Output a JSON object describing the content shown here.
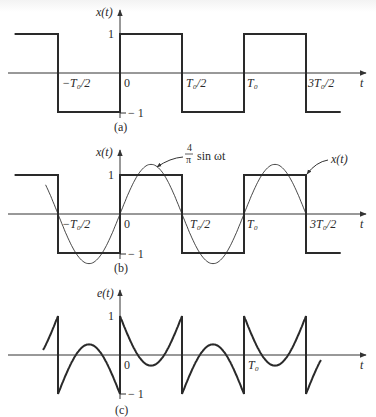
{
  "figure": {
    "x_axis_label": "t",
    "tick_labels": {
      "neg_half": "−T₀/2",
      "zero": "0",
      "half": "T₀/2",
      "t0": "T₀",
      "three_half": "3T₀/2"
    },
    "panels": [
      {
        "id": "a",
        "caption": "(a)",
        "y_axis_label": "x(t)",
        "level_high_label": "1",
        "level_low_label": "− 1",
        "signal": "square wave"
      },
      {
        "id": "b",
        "caption": "(b)",
        "y_axis_label": "x(t)",
        "level_high_label": "1",
        "level_low_label": "− 1",
        "annotation_sine": "4/π sin ωt",
        "annotation_sine_num": "4",
        "annotation_sine_den": "π",
        "annotation_sine_text": "sin ωt",
        "annotation_square": "x(t)",
        "signal": "square wave with fundamental sine approximation"
      },
      {
        "id": "c",
        "caption": "(c)",
        "y_axis_label": "e(t)",
        "level_high_label": "1",
        "level_low_label": "− 1",
        "signal": "error e(t) = x(t) − (4/π) sin ωt"
      }
    ]
  },
  "chart_data": [
    {
      "type": "line",
      "title": "(a) Square wave x(t)",
      "xlabel": "t",
      "ylabel": "x(t)",
      "x_ticks": [
        "−T0/2",
        "0",
        "T0/2",
        "T0",
        "3T0/2"
      ],
      "ylim": [
        -1,
        1
      ],
      "series": [
        {
          "name": "x(t)",
          "x": [
            -0.85,
            -0.5,
            -0.5,
            0,
            0,
            0.5,
            0.5,
            1.0,
            1.0,
            1.5,
            1.5,
            1.78
          ],
          "values": [
            1,
            1,
            -1,
            -1,
            1,
            1,
            -1,
            -1,
            1,
            1,
            -1,
            -1
          ]
        }
      ]
    },
    {
      "type": "line",
      "title": "(b) Square wave with fundamental",
      "xlabel": "t",
      "ylabel": "x(t)",
      "x_ticks": [
        "−T0/2",
        "0",
        "T0/2",
        "T0",
        "3T0/2"
      ],
      "ylim": [
        -1.273,
        1.273
      ],
      "series": [
        {
          "name": "x(t)",
          "x": [
            -0.85,
            -0.5,
            -0.5,
            0,
            0,
            0.5,
            0.5,
            1.0,
            1.0,
            1.5,
            1.5,
            1.78
          ],
          "values": [
            1,
            1,
            -1,
            -1,
            1,
            1,
            -1,
            -1,
            1,
            1,
            -1,
            -1
          ]
        },
        {
          "name": "4/π sin ωt",
          "x_range": [
            -0.6,
            1.5
          ],
          "amplitude": 1.273
        }
      ]
    },
    {
      "type": "line",
      "title": "(c) Error e(t)",
      "xlabel": "t",
      "ylabel": "e(t)",
      "x_ticks": [
        "0",
        "T0"
      ],
      "ylim": [
        -1,
        1
      ],
      "series": [
        {
          "name": "e(t) = x(t) − (4/π) sin ωt",
          "x_range": [
            -0.62,
            1.62
          ],
          "jump_points": [
            -0.5,
            0,
            0.5,
            1.0,
            1.5
          ],
          "local_extrema": 0.273
        }
      ]
    }
  ],
  "geometry": {
    "x_origin": 120,
    "half_period_px": 62,
    "x_start": 25,
    "x_end": 340,
    "axis_x_end": 366,
    "panels": [
      {
        "axis_y": 73,
        "amp": 39,
        "axis_top": 10
      },
      {
        "axis_y": 214,
        "amp": 39,
        "axis_top": 150
      },
      {
        "axis_y": 355,
        "amp": 39,
        "axis_top": 290
      }
    ]
  }
}
